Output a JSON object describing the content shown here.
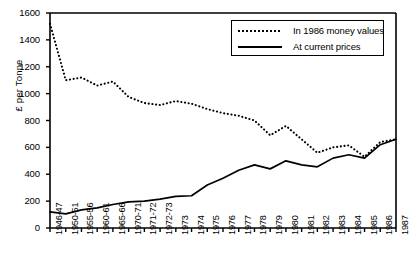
{
  "chart_data": {
    "type": "line",
    "title": "",
    "xlabel": "",
    "ylabel": "£ per Tonne",
    "ylim": [
      0,
      1600
    ],
    "yticks": [
      0,
      200,
      400,
      600,
      800,
      1000,
      1200,
      1400,
      1600
    ],
    "grid": false,
    "legend_position": "top-right",
    "categories": [
      "1946-47",
      "1950-51",
      "1955-56",
      "1960-61",
      "1965-66",
      "1970-71",
      "1971-72",
      "1972-73",
      "1973",
      "1974",
      "1975",
      "1976",
      "1977",
      "1978",
      "1979",
      "1980",
      "1981",
      "1982",
      "1983",
      "1984",
      "1985",
      "1986",
      "1987"
    ],
    "series": [
      {
        "name": "In 1986 money values",
        "style": "dotted",
        "values": [
          1520,
          1100,
          1120,
          1060,
          1090,
          975,
          930,
          915,
          945,
          925,
          885,
          855,
          835,
          800,
          690,
          760,
          660,
          560,
          600,
          615,
          530,
          640,
          660
        ]
      },
      {
        "name": "At current prices",
        "style": "solid",
        "values": [
          120,
          105,
          135,
          150,
          175,
          195,
          200,
          215,
          235,
          240,
          320,
          370,
          430,
          470,
          440,
          500,
          470,
          455,
          520,
          545,
          520,
          620,
          660
        ]
      }
    ]
  },
  "legend": {
    "items": [
      {
        "label": "In 1986 money values",
        "style": "dotted"
      },
      {
        "label": "At current prices",
        "style": "solid"
      }
    ]
  },
  "axis": {
    "y_label": "£ per Tonne"
  },
  "colors": {
    "line": "#000000",
    "background": "#ffffff",
    "axis": "#000000"
  }
}
